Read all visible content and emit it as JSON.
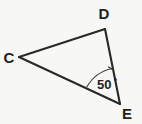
{
  "figure": {
    "type": "geometry-diagram",
    "shape": "triangle",
    "name": "triangle-CDE",
    "background_color": "#f7f7f5",
    "line_color": "#2b2927",
    "label_color": "#231f20",
    "width": 142,
    "height": 124
  },
  "vertices": [
    {
      "id": "C",
      "label": "C",
      "x": 19,
      "y": 57,
      "label_x": 9,
      "label_y": 63
    },
    {
      "id": "D",
      "label": "D",
      "x": 105,
      "y": 29,
      "label_x": 104,
      "label_y": 19
    },
    {
      "id": "E",
      "label": "E",
      "x": 120,
      "y": 104,
      "label_x": 127,
      "label_y": 119
    }
  ],
  "sides": [
    {
      "name": "side-CD",
      "from": "C",
      "to": "D",
      "path": "M 19 57 L 105 29"
    },
    {
      "name": "side-DE",
      "from": "D",
      "to": "E",
      "path": "M 105 29 L 120 104"
    },
    {
      "name": "side-EC",
      "from": "E",
      "to": "C",
      "path": "M 120 104 L 19 57"
    }
  ],
  "angles": [
    {
      "name": "angle-E",
      "at_vertex": "E",
      "value": "50",
      "degree_symbol": "º",
      "full_label": "50º",
      "label_x": 97,
      "label_y": 89,
      "arc_path": "M 86.5 87.6 A 38 38 0 0 1 112.3 68.5",
      "tick_path": "M 108.6 66.9 L 113.6 70.2"
    }
  ],
  "chart_data": {
    "type": "diagram",
    "annotations": [
      "C",
      "D",
      "E",
      "50º"
    ]
  }
}
